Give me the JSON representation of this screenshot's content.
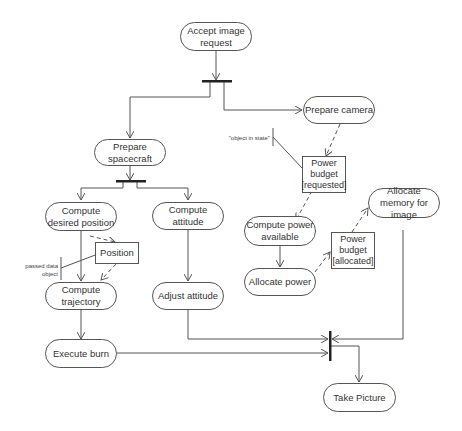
{
  "diagram": {
    "type": "UML activity diagram",
    "actions": {
      "accept_image_request": "Accept image request",
      "prepare_spacecraft": "Prepare spacecraft",
      "prepare_camera": "Prepare camera",
      "compute_desired_position": "Compute desired position",
      "compute_attitude": "Compute attitude",
      "compute_trajectory": "Compute trajectory",
      "adjust_attitude": "Adjust attitude",
      "execute_burn": "Execute burn",
      "compute_power_available": "Compute power available",
      "allocate_power": "Allocate power",
      "allocate_memory": "Allocate memory for image",
      "take_picture": "Take Picture"
    },
    "objects": {
      "power_budget_requested": "Power budget [requested]",
      "power_budget_allocated": "Power budget [allocated]",
      "position": "Position"
    },
    "notes": {
      "object_in_state": "\"object in state\"",
      "passed_data_object": "passed data object"
    }
  }
}
